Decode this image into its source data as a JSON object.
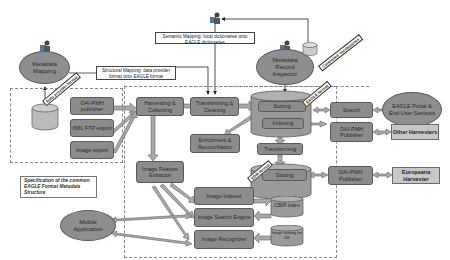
{
  "diagram": {
    "ellipses": {
      "metadata_mapping": "Metadata Mapping",
      "metadata_record_inspector": "Metadata Record Inspector",
      "eagle_portal": "EAGLE Portal & End-User Services",
      "mobile_application": "Mobile Application"
    },
    "notes": {
      "structural_mapping": "Structural Mapping: data provider format onto EAGLE format",
      "semantic_mapping": "Semantic Mapping: local dictionaries onto EAGLE dictionaries",
      "specification": "Specification of the common EAGLE Format Metadata Structure"
    },
    "tags": {
      "data_provider_format": "Data provider format",
      "controlled_vocabularies": "Controlled Vocabularies",
      "eagle_format": "EAGLE format",
      "edm_format": "EDM format"
    },
    "provider_boxes": {
      "oai_pmh_publisher": "OAI-PMH publisher",
      "xml_ftp_export": "XML FTP export",
      "image_export": "Image export"
    },
    "process_boxes": {
      "harvesting": "Harvesting & Collecting",
      "transforming_cleaning": "Transforming & Cleaning",
      "enrichment": "Enrichment & Reconciliation",
      "storing_top": "Storing",
      "indexing": "Indexing",
      "transforming": "Transforming",
      "storing_bottom": "Storing",
      "search": "Search",
      "oai_pmh_publisher_top": "OAI-PMH Publisher",
      "oai_pmh_publisher_bottom": "OAI-PMH Publisher",
      "image_feature_extractor": "Image Feature Extractor",
      "image_indexer": "Image Indexer",
      "image_search_engine": "Image Search Engine",
      "image_recognizer": "Image Recognizer"
    },
    "databases": {
      "cbir_index": "CBIR index",
      "image_training_db": "Image training set DB"
    },
    "external": {
      "other_harvesters": "Other Harvesters",
      "europeana_harvester": "Europeana Harvester"
    },
    "colors": {
      "box_fill": "#8c8c8c",
      "box_border": "#5a5a5a",
      "light_box_fill": "#c8c8c8",
      "arrow_fill": "#a8a8a8"
    }
  }
}
